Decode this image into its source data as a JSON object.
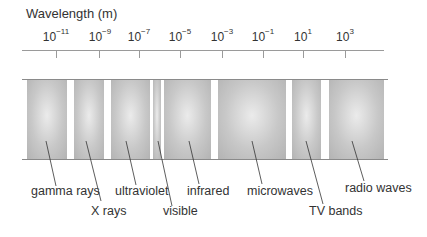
{
  "title": "Wavelength  (m)",
  "axis": {
    "ticks": [
      {
        "base": "10",
        "exp": "−11",
        "x": 56
      },
      {
        "base": "10",
        "exp": "−9",
        "x": 100
      },
      {
        "base": "10",
        "exp": "−7",
        "x": 139
      },
      {
        "base": "10",
        "exp": "−5",
        "x": 180
      },
      {
        "base": "10",
        "exp": "−3",
        "x": 222
      },
      {
        "base": "10",
        "exp": "−1",
        "x": 263
      },
      {
        "base": "10",
        "exp": "1",
        "x": 303
      },
      {
        "base": "10",
        "exp": "3",
        "x": 345
      }
    ]
  },
  "bands": [
    {
      "name": "gamma rays",
      "x": 27,
      "w": 40
    },
    {
      "name": "X rays",
      "x": 74,
      "w": 30
    },
    {
      "name": "ultraviolet",
      "x": 111,
      "w": 39
    },
    {
      "name": "visible",
      "x": 153,
      "w": 8
    },
    {
      "name": "infrared",
      "x": 164,
      "w": 47
    },
    {
      "name": "microwaves",
      "x": 218,
      "w": 68
    },
    {
      "name": "TV bands",
      "x": 292,
      "w": 29
    },
    {
      "name": "radio waves",
      "x": 329,
      "w": 55
    }
  ],
  "labels": {
    "gamma": "gamma rays",
    "xrays": "X rays",
    "uv": "ultraviolet",
    "visible": "visible",
    "infrared": "infrared",
    "microwaves": "microwaves",
    "tv": "TV bands",
    "radio": "radio waves"
  }
}
